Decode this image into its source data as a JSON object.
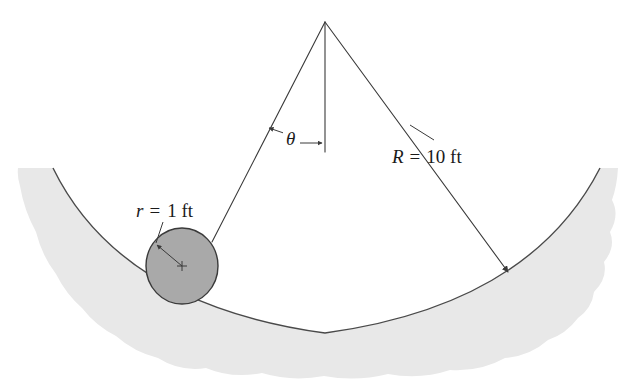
{
  "figure": {
    "type": "engineering-diagram",
    "background_color": "#ffffff",
    "width": 637,
    "height": 385
  },
  "labels": {
    "radius_large": {
      "symbol": "R",
      "equals": "=",
      "value": "10 ft",
      "full_text": "R = 10 ft",
      "x": 392,
      "y": 163
    },
    "radius_small": {
      "symbol": "r",
      "equals": "=",
      "value": "1 ft",
      "full_text": "r = 1 ft",
      "x": 136,
      "y": 217
    },
    "angle": {
      "symbol": "θ",
      "name": "theta",
      "x": 286,
      "y": 145
    }
  },
  "geometry": {
    "apex": {
      "x": 325,
      "y": 22
    },
    "trough_arc": {
      "path": "M 53 168 Q 120 305 325 333 Q 530 305 600 168",
      "center_x": 325,
      "stroke_color": "#4a4a4a"
    },
    "trough_band": {
      "path": "M 53 168 Q 120 305 325 333 Q 530 305 600 168 L 618 168 Q 617 186 612 200 Q 620 215 610 232 Q 616 247 604 262 Q 608 278 594 292 Q 592 308 578 318 Q 566 334 548 340 Q 530 356 505 358 Q 480 372 450 370 Q 420 380 388 374 Q 356 382 324 376 Q 292 382 262 373 Q 232 379 206 368 Q 180 372 158 358 Q 134 352 116 336 Q 96 326 82 308 Q 66 294 56 274 Q 42 256 36 232 Q 24 210 20 186 Q 17 176 18 168 Z",
      "fill_color": "#e8e8e8"
    },
    "ball": {
      "cx": 182,
      "cy": 266,
      "rx": 36,
      "ry": 38,
      "fill_color": "#a9a9a9",
      "stroke_color": "#3a3a3a",
      "center_mark": {
        "x": 182,
        "y": 266,
        "size": 5
      }
    },
    "left_radius_line": {
      "x1": 325,
      "y1": 22,
      "x2": 212,
      "y2": 242
    },
    "right_radius_line": {
      "x1": 325,
      "y1": 22,
      "x2": 508,
      "y2": 272
    },
    "center_vertical_line": {
      "x1": 325,
      "y1": 22,
      "x2": 325,
      "y2": 152
    },
    "angle_arrow": {
      "left_tip_x": 269,
      "left_tip_y": 128,
      "right_tip_x": 322,
      "right_tip_y": 143,
      "mid_gap_left": 283,
      "mid_gap_right": 300
    },
    "ball_radius_arrow": {
      "x1": 182,
      "y1": 266,
      "x2": 157,
      "y2": 245
    },
    "small_label_leader": {
      "x1": 163,
      "y1": 222,
      "x2": 156,
      "y2": 243
    }
  },
  "colors": {
    "line": "#3a3a3a",
    "arc": "#4a4a4a",
    "ball_fill": "#a9a9a9",
    "band_fill": "#e8e8e8",
    "text": "#1a1a1a",
    "background": "#ffffff"
  }
}
